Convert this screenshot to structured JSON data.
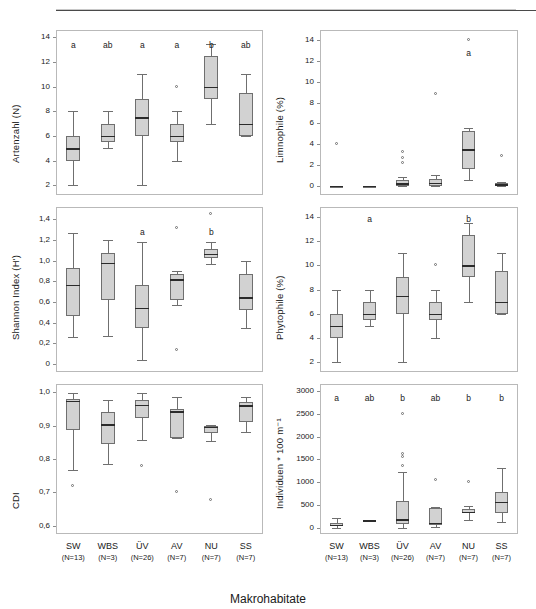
{
  "figure": {
    "xaxis_title": "Makrohabitate",
    "categories": [
      "SW",
      "WBS",
      "ÜV",
      "AV",
      "NU",
      "SS"
    ],
    "category_n": [
      "(N=13)",
      "(N=3)",
      "(N=26)",
      "(N=7)",
      "(N=7)",
      "(N=7)"
    ],
    "box_fill": "#d2d2d2",
    "box_stroke": "#6f6f6f",
    "median_color": "#2b2b2b"
  },
  "chart_data": [
    {
      "id": "artenzahl",
      "type": "box",
      "title": "",
      "ylabel": "Artenzahl (N)",
      "xlabel": "",
      "ylim": [
        1.2,
        14.6
      ],
      "yticks": [
        2,
        4,
        6,
        8,
        10,
        12,
        14
      ],
      "ytick_labels": [
        "2",
        "4",
        "6",
        "8",
        "10",
        "12",
        "14"
      ],
      "categories": [
        "SW",
        "WBS",
        "ÜV",
        "AV",
        "NU",
        "SS"
      ],
      "sig_letters": [
        "a",
        "ab",
        "a",
        "a",
        "b",
        "ab"
      ],
      "sig_letter_y": 13.3,
      "boxes": [
        {
          "cat": "SW",
          "whisker_low": 2.0,
          "q1": 4.0,
          "median": 5.0,
          "q3": 6.0,
          "whisker_high": 8.0,
          "outliers": []
        },
        {
          "cat": "WBS",
          "whisker_low": 5.0,
          "q1": 5.5,
          "median": 6.0,
          "q3": 7.0,
          "whisker_high": 8.0,
          "outliers": []
        },
        {
          "cat": "ÜV",
          "whisker_low": 2.0,
          "q1": 6.0,
          "median": 7.5,
          "q3": 9.0,
          "whisker_high": 11.0,
          "outliers": []
        },
        {
          "cat": "AV",
          "whisker_low": 4.0,
          "q1": 5.5,
          "median": 6.0,
          "q3": 7.0,
          "whisker_high": 8.0,
          "outliers": [
            10.0
          ]
        },
        {
          "cat": "NU",
          "whisker_low": 7.0,
          "q1": 9.0,
          "median": 10.0,
          "q3": 12.5,
          "whisker_high": 13.5,
          "outliers": []
        },
        {
          "cat": "SS",
          "whisker_low": 6.0,
          "q1": 6.0,
          "median": 7.0,
          "q3": 9.5,
          "whisker_high": 11.0,
          "outliers": []
        }
      ]
    },
    {
      "id": "limnophile",
      "type": "box",
      "title": "",
      "ylabel": "Limnophile (%)",
      "xlabel": "",
      "ylim": [
        -0.9,
        15.0
      ],
      "yticks": [
        0,
        2,
        4,
        6,
        8,
        10,
        12,
        14
      ],
      "ytick_labels": [
        "0",
        "2",
        "4",
        "6",
        "8",
        "10",
        "12",
        "14"
      ],
      "categories": [
        "SW",
        "WBS",
        "ÜV",
        "AV",
        "NU",
        "SS"
      ],
      "sig_letters": [
        "",
        "",
        "",
        "",
        "a",
        ""
      ],
      "sig_letter_y": 12.7,
      "boxes": [
        {
          "cat": "SW",
          "whisker_low": 0.0,
          "q1": 0.0,
          "median": 0.0,
          "q3": 0.0,
          "whisker_high": 0.0,
          "outliers": [
            4.0
          ]
        },
        {
          "cat": "WBS",
          "whisker_low": 0.0,
          "q1": 0.0,
          "median": 0.0,
          "q3": 0.0,
          "whisker_high": 0.0,
          "outliers": []
        },
        {
          "cat": "ÜV",
          "whisker_low": 0.0,
          "q1": 0.0,
          "median": 0.25,
          "q3": 0.5,
          "whisker_high": 0.8,
          "outliers": [
            2.2,
            2.7,
            3.2
          ]
        },
        {
          "cat": "AV",
          "whisker_low": 0.0,
          "q1": 0.0,
          "median": 0.3,
          "q3": 0.6,
          "whisker_high": 1.0,
          "outliers": [
            8.8
          ]
        },
        {
          "cat": "NU",
          "whisker_low": 0.5,
          "q1": 1.6,
          "median": 3.5,
          "q3": 5.3,
          "whisker_high": 5.6,
          "outliers": [
            14.0
          ]
        },
        {
          "cat": "SS",
          "whisker_low": 0.0,
          "q1": 0.0,
          "median": 0.15,
          "q3": 0.3,
          "whisker_high": 0.4,
          "outliers": [
            2.9
          ]
        }
      ]
    },
    {
      "id": "shannon",
      "type": "box",
      "title": "",
      "ylabel": "Shannon Index (H')",
      "xlabel": "",
      "ylim": [
        -0.08,
        1.52
      ],
      "yticks": [
        0,
        0.2,
        0.4,
        0.6,
        0.8,
        1.0,
        1.2,
        1.4
      ],
      "ytick_labels": [
        "0",
        "0,2",
        "0,4",
        "0,6",
        "0,8",
        "1,0",
        "1,2",
        "1,4"
      ],
      "categories": [
        "SW",
        "WBS",
        "ÜV",
        "AV",
        "NU",
        "SS"
      ],
      "sig_letters": [
        "",
        "",
        "a",
        "",
        "b",
        ""
      ],
      "sig_letter_y": 1.27,
      "boxes": [
        {
          "cat": "SW",
          "whisker_low": 0.26,
          "q1": 0.46,
          "median": 0.765,
          "q3": 0.925,
          "whisker_high": 1.27,
          "outliers": []
        },
        {
          "cat": "WBS",
          "whisker_low": 0.265,
          "q1": 0.615,
          "median": 0.98,
          "q3": 1.075,
          "whisker_high": 1.2,
          "outliers": []
        },
        {
          "cat": "ÜV",
          "whisker_low": 0.04,
          "q1": 0.345,
          "median": 0.545,
          "q3": 0.765,
          "whisker_high": 1.18,
          "outliers": []
        },
        {
          "cat": "AV",
          "whisker_low": 0.565,
          "q1": 0.615,
          "median": 0.82,
          "q3": 0.875,
          "whisker_high": 0.9,
          "outliers": [
            1.32,
            0.135
          ]
        },
        {
          "cat": "NU",
          "whisker_low": 0.965,
          "q1": 1.025,
          "median": 1.065,
          "q3": 1.11,
          "whisker_high": 1.18,
          "outliers": [
            1.455
          ]
        },
        {
          "cat": "SS",
          "whisker_low": 0.345,
          "q1": 0.52,
          "median": 0.645,
          "q3": 0.875,
          "whisker_high": 1.0,
          "outliers": []
        }
      ]
    },
    {
      "id": "phytophile",
      "type": "box",
      "title": "",
      "ylabel": "Phytophile (%)",
      "xlabel": "",
      "ylim": [
        1.2,
        14.8
      ],
      "yticks": [
        2,
        4,
        6,
        8,
        10,
        12,
        14
      ],
      "ytick_labels": [
        "2",
        "4",
        "6",
        "8",
        "10",
        "12",
        "14"
      ],
      "categories": [
        "SW",
        "WBS",
        "ÜV",
        "AV",
        "NU",
        "SS"
      ],
      "sig_letters": [
        "",
        "a",
        "",
        "",
        "b",
        ""
      ],
      "sig_letter_y": 13.7,
      "boxes": [
        {
          "cat": "SW",
          "whisker_low": 2.0,
          "q1": 4.0,
          "median": 5.0,
          "q3": 6.0,
          "whisker_high": 8.0,
          "outliers": []
        },
        {
          "cat": "WBS",
          "whisker_low": 5.0,
          "q1": 5.5,
          "median": 6.0,
          "q3": 7.0,
          "whisker_high": 8.0,
          "outliers": []
        },
        {
          "cat": "ÜV",
          "whisker_low": 2.0,
          "q1": 6.0,
          "median": 7.5,
          "q3": 9.0,
          "whisker_high": 11.0,
          "outliers": []
        },
        {
          "cat": "AV",
          "whisker_low": 4.0,
          "q1": 5.5,
          "median": 6.0,
          "q3": 7.0,
          "whisker_high": 8.0,
          "outliers": [
            10.0
          ]
        },
        {
          "cat": "NU",
          "whisker_low": 7.0,
          "q1": 9.0,
          "median": 10.0,
          "q3": 12.5,
          "whisker_high": 13.5,
          "outliers": []
        },
        {
          "cat": "SS",
          "whisker_low": 6.0,
          "q1": 6.0,
          "median": 7.0,
          "q3": 9.5,
          "whisker_high": 11.0,
          "outliers": []
        }
      ]
    },
    {
      "id": "cdi",
      "type": "box",
      "title": "",
      "ylabel": "CDI",
      "xlabel": "Makrohabitate",
      "ylim": [
        0.575,
        1.025
      ],
      "yticks": [
        0.6,
        0.7,
        0.8,
        0.9,
        1.0
      ],
      "ytick_labels": [
        "0,6",
        "0,7",
        "0,8",
        "0,9",
        "1,0"
      ],
      "categories": [
        "SW",
        "WBS",
        "ÜV",
        "AV",
        "NU",
        "SS"
      ],
      "sig_letters": [
        "",
        "",
        "",
        "",
        "",
        ""
      ],
      "sig_letter_y": 1.0,
      "boxes": [
        {
          "cat": "SW",
          "whisker_low": 0.766,
          "q1": 0.888,
          "median": 0.975,
          "q3": 0.981,
          "whisker_high": 0.997,
          "outliers": [
            0.718
          ]
        },
        {
          "cat": "WBS",
          "whisker_low": 0.785,
          "q1": 0.845,
          "median": 0.905,
          "q3": 0.941,
          "whisker_high": 0.977,
          "outliers": []
        },
        {
          "cat": "ÜV",
          "whisker_low": 0.858,
          "q1": 0.922,
          "median": 0.963,
          "q3": 0.978,
          "whisker_high": 0.998,
          "outliers": [
            0.778
          ]
        },
        {
          "cat": "AV",
          "whisker_low": 0.862,
          "q1": 0.864,
          "median": 0.944,
          "q3": 0.951,
          "whisker_high": 0.985,
          "outliers": [
            0.7
          ]
        },
        {
          "cat": "NU",
          "whisker_low": 0.855,
          "q1": 0.878,
          "median": 0.897,
          "q3": 0.9,
          "whisker_high": 0.903,
          "outliers": [
            0.678
          ]
        },
        {
          "cat": "SS",
          "whisker_low": 0.882,
          "q1": 0.912,
          "median": 0.962,
          "q3": 0.972,
          "whisker_high": 0.985,
          "outliers": []
        }
      ]
    },
    {
      "id": "individuen",
      "type": "box",
      "title": "",
      "ylabel": "Individuen * 100 m⁻¹",
      "xlabel": "Makrohabitate",
      "ylim": [
        -130,
        3150
      ],
      "yticks": [
        0,
        500,
        1000,
        1500,
        2000,
        2500,
        3000
      ],
      "ytick_labels": [
        "0",
        "500",
        "1000",
        "1500",
        "2000",
        "2500",
        "3000"
      ],
      "categories": [
        "SW",
        "WBS",
        "ÜV",
        "AV",
        "NU",
        "SS"
      ],
      "sig_letters": [
        "a",
        "ab",
        "b",
        "ab",
        "b",
        "b"
      ],
      "sig_letter_y": 2830,
      "boxes": [
        {
          "cat": "SW",
          "whisker_low": 10,
          "q1": 40,
          "median": 75,
          "q3": 120,
          "whisker_high": 215,
          "outliers": []
        },
        {
          "cat": "WBS",
          "whisker_low": 160,
          "q1": 165,
          "median": 172,
          "q3": 180,
          "whisker_high": 185,
          "outliers": []
        },
        {
          "cat": "ÜV",
          "whisker_low": 5,
          "q1": 80,
          "median": 190,
          "q3": 585,
          "whisker_high": 1215,
          "outliers": [
            2495,
            1630,
            1555,
            1350
          ]
        },
        {
          "cat": "AV",
          "whisker_low": 15,
          "q1": 60,
          "median": 120,
          "q3": 445,
          "whisker_high": 470,
          "outliers": [
            1045
          ]
        },
        {
          "cat": "NU",
          "whisker_low": 185,
          "q1": 320,
          "median": 360,
          "q3": 420,
          "whisker_high": 480,
          "outliers": [
            1000
          ]
        },
        {
          "cat": "SS",
          "whisker_low": 130,
          "q1": 320,
          "median": 570,
          "q3": 790,
          "whisker_high": 1305,
          "outliers": []
        }
      ]
    }
  ]
}
